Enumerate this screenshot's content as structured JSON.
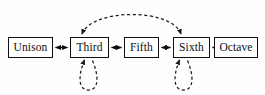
{
  "diagram": {
    "type": "state-transition-diagram",
    "canvas": {
      "width": 265,
      "height": 95,
      "background": "#fefefe"
    },
    "style": {
      "node_border_color": "#111111",
      "node_fill_color": "#ffffff",
      "solid_edge_color": "#0d0d0d",
      "dashed_edge_color": "#1a1a1a",
      "label_color": "#0d0d0d"
    },
    "nodes": [
      {
        "id": "unison",
        "label": "Unison",
        "x": 8,
        "y": 37,
        "width": 45
      },
      {
        "id": "third",
        "label": "Third",
        "x": 70,
        "y": 37,
        "width": 39
      },
      {
        "id": "fifth",
        "label": "Fifth",
        "x": 124,
        "y": 37,
        "width": 35
      },
      {
        "id": "sixth",
        "label": "Sixth",
        "x": 173,
        "y": 37,
        "width": 37
      },
      {
        "id": "octave",
        "label": "Octave",
        "x": 214,
        "y": 37,
        "width": 44
      }
    ],
    "edges": [
      {
        "id": "unison-third",
        "from": "unison",
        "to": "third",
        "style": "solid",
        "arrows": "both",
        "shape": "straight"
      },
      {
        "id": "third-fifth",
        "from": "third",
        "to": "fifth",
        "style": "solid",
        "arrows": "both",
        "shape": "straight"
      },
      {
        "id": "fifth-sixth",
        "from": "fifth",
        "to": "sixth",
        "style": "solid",
        "arrows": "both",
        "shape": "straight"
      },
      {
        "id": "sixth-octave",
        "from": "sixth",
        "to": "octave",
        "style": "solid",
        "arrows": "both",
        "shape": "straight"
      },
      {
        "id": "third-sixth-arc",
        "from": "third",
        "to": "sixth",
        "style": "dashed",
        "arrows": "both",
        "shape": "arc-above"
      },
      {
        "id": "third-self",
        "from": "third",
        "to": "third",
        "style": "dashed",
        "arrows": "single",
        "shape": "self-loop-below"
      },
      {
        "id": "sixth-self",
        "from": "sixth",
        "to": "sixth",
        "style": "dashed",
        "arrows": "single",
        "shape": "self-loop-below"
      }
    ]
  }
}
